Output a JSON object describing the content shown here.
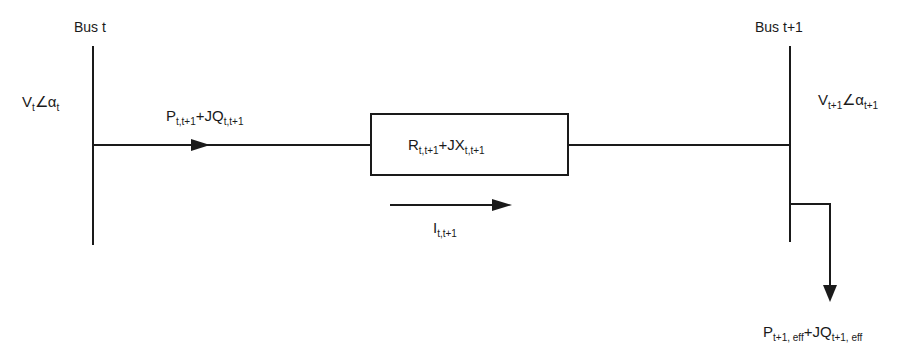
{
  "diagram": {
    "type": "power-line two-bus model",
    "buses": [
      {
        "label": "Bus t",
        "voltage": {
          "main": "V",
          "sub": "t",
          "angle": "∠",
          "angle_sym": "α",
          "angle_sub": "t"
        }
      },
      {
        "label": "Bus t+1",
        "voltage": {
          "main": "V",
          "sub": "t+1",
          "angle": "∠",
          "angle_sym": "α",
          "angle_sub": "t+1"
        }
      }
    ],
    "power_flow": {
      "p": "P",
      "p_sub": "t,t+1",
      "plus": "+JQ",
      "q_sub": "t,t+1"
    },
    "impedance": {
      "r": "R",
      "r_sub": "t,t+1",
      "plus": "+JX",
      "x_sub": "t,t+1"
    },
    "current": {
      "main": "I",
      "sub": "t,t+1"
    },
    "load": {
      "p": "P",
      "p_sub": "t+1, eff",
      "plus": "+JQ",
      "q_sub": "t+1, eff"
    },
    "colors": {
      "line": "#1a1a1a",
      "background": "#ffffff"
    }
  }
}
